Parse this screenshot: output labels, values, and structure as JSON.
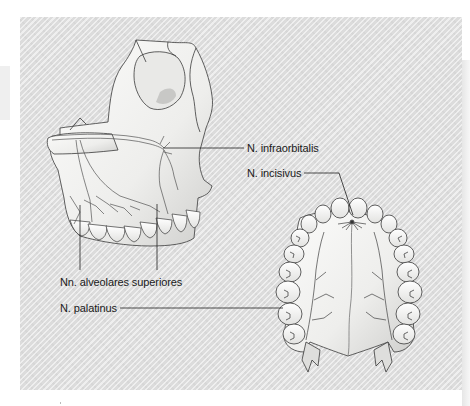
{
  "figure": {
    "labels": {
      "infraorbitalis": "N. infraorbitalis",
      "incisivus": "N. incisivus",
      "alveolares": "Nn. alveolares superiores",
      "palatinus": "N. palatinus"
    },
    "colors": {
      "panel_background": "#dcdcdc",
      "bone": "#f4f4f2",
      "outline": "#3a3a3a",
      "nerve": "#555555",
      "leader_line": "#222222"
    }
  }
}
